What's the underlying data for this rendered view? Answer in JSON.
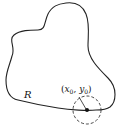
{
  "diagram": {
    "region_label": "R",
    "point_label": {
      "open": "(",
      "x": "x",
      "x_sub": "0",
      "comma": ", ",
      "y": "y",
      "y_sub": "0",
      "close": ")"
    },
    "colors": {
      "stroke": "#222222",
      "background": "#ffffff"
    }
  }
}
